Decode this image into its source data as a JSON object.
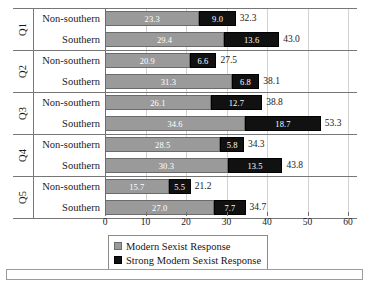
{
  "chart_data": {
    "type": "bar",
    "orientation": "horizontal",
    "stacked": true,
    "title": "",
    "xlabel": "",
    "ylabel": "",
    "xlim": [
      0,
      60
    ],
    "xticks": [
      0,
      10,
      20,
      30,
      40,
      50,
      60
    ],
    "xtick_labels": [
      "0",
      "10",
      "20",
      "30",
      "40",
      "50",
      "60"
    ],
    "grid": true,
    "grid_axis": "x",
    "legend_position": "bottom",
    "series": [
      {
        "name": "Modern Sexist Response",
        "color": "#9a9a9a",
        "values": [
          23.3,
          29.4,
          20.9,
          31.3,
          26.1,
          34.6,
          28.5,
          30.3,
          15.7,
          27.0
        ]
      },
      {
        "name": "Strong Modern Sexist Response",
        "color": "#111111",
        "values": [
          9.0,
          13.6,
          6.6,
          6.8,
          12.7,
          18.7,
          5.8,
          13.5,
          5.5,
          7.7
        ]
      }
    ],
    "groups": [
      {
        "label": "Q1",
        "rows": [
          {
            "label": "Non-southern",
            "modern": 23.3,
            "strong": 9.0,
            "total": 32.3
          },
          {
            "label": "Southern",
            "modern": 29.4,
            "strong": 13.6,
            "total": 43.0
          }
        ]
      },
      {
        "label": "Q2",
        "rows": [
          {
            "label": "Non-southern",
            "modern": 20.9,
            "strong": 6.6,
            "total": 27.5
          },
          {
            "label": "Southern",
            "modern": 31.3,
            "strong": 6.8,
            "total": 38.1
          }
        ]
      },
      {
        "label": "Q3",
        "rows": [
          {
            "label": "Non-southern",
            "modern": 26.1,
            "strong": 12.7,
            "total": 38.8
          },
          {
            "label": "Southern",
            "modern": 34.6,
            "strong": 18.7,
            "total": 53.3
          }
        ]
      },
      {
        "label": "Q4",
        "rows": [
          {
            "label": "Non-southern",
            "modern": 28.5,
            "strong": 5.8,
            "total": 34.3
          },
          {
            "label": "Southern",
            "modern": 30.3,
            "strong": 13.5,
            "total": 43.8
          }
        ]
      },
      {
        "label": "Q5",
        "rows": [
          {
            "label": "Non-southern",
            "modern": 15.7,
            "strong": 5.5,
            "total": 21.2
          },
          {
            "label": "Southern",
            "modern": 27.0,
            "strong": 7.7,
            "total": 34.7
          }
        ]
      }
    ],
    "value_labels": {
      "q1_ns_modern": "23.3",
      "q1_ns_strong": "9.0",
      "q1_ns_total": "32.3",
      "q1_s_modern": "29.4",
      "q1_s_strong": "13.6",
      "q1_s_total": "43.0",
      "q2_ns_modern": "20.9",
      "q2_ns_strong": "6.6",
      "q2_ns_total": "27.5",
      "q2_s_modern": "31.3",
      "q2_s_strong": "6.8",
      "q2_s_total": "38.1",
      "q3_ns_modern": "26.1",
      "q3_ns_strong": "12.7",
      "q3_ns_total": "38.8",
      "q3_s_modern": "34.6",
      "q3_s_strong": "18.7",
      "q3_s_total": "53.3",
      "q4_ns_modern": "28.5",
      "q4_ns_strong": "5.8",
      "q4_ns_total": "34.3",
      "q4_s_modern": "30.3",
      "q4_s_strong": "13.5",
      "q4_s_total": "43.8",
      "q5_ns_modern": "15.7",
      "q5_ns_strong": "5.5",
      "q5_ns_total": "21.2",
      "q5_s_modern": "27.0",
      "q5_s_strong": "7.7",
      "q5_s_total": "34.7"
    }
  },
  "legend": {
    "items": [
      {
        "label": "Modern Sexist Response",
        "color": "#9a9a9a"
      },
      {
        "label": "Strong Modern Sexist Response",
        "color": "#111111"
      }
    ]
  },
  "colors": {
    "modern": "#9a9a9a",
    "strong": "#111111",
    "rule": "#767676",
    "gridline": "#d2d2d2",
    "text": "#1a1a1a"
  }
}
